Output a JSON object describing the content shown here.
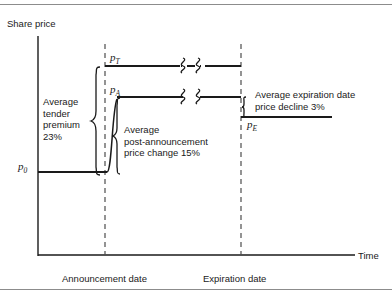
{
  "figure": {
    "type": "line-diagram",
    "axes": {
      "y_axis_label": "Share price",
      "x_axis_label": "Time",
      "x_tick_labels": [
        "Announcement date",
        "Expiration date"
      ]
    },
    "price_levels": [
      {
        "key": "p0",
        "symbol": "p",
        "subscript": "0",
        "label": "p0",
        "description": "Pre-announcement share price",
        "y_px": 172
      },
      {
        "key": "pA",
        "symbol": "p",
        "subscript": "A",
        "label": "pA",
        "description": "Post-announcement share price",
        "y_px": 97
      },
      {
        "key": "pT",
        "symbol": "p",
        "subscript": "T",
        "label": "pT",
        "description": "Tender offer price",
        "y_px": 66
      },
      {
        "key": "pE",
        "symbol": "p",
        "subscript": "E",
        "label": "pE",
        "description": "Expiration date share price",
        "y_px": 117
      }
    ],
    "annotations": {
      "tender_premium": "Average\ntender\npremium\n23%",
      "post_announcement": "Average\npost-announcement\nprice change 15%",
      "expiration_decline": "Average expiration date\nprice decline 3%"
    },
    "values": {
      "tender_premium_pct": "23%",
      "post_announcement_change_pct": "15%",
      "expiration_price_decline_pct": "3%"
    },
    "colors": {
      "ink": "#1a1a1a",
      "rule": "#8c8c8c",
      "background": "#ffffff"
    }
  }
}
